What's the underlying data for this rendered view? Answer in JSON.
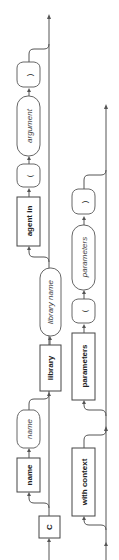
{
  "diagram": {
    "type": "railroad-syntax-diagram",
    "orientation": "rotated-90-ccw",
    "tracks": [
      {
        "id": "track-1",
        "nodes": [
          {
            "kind": "keyword",
            "label": "C"
          },
          {
            "kind": "keyword",
            "label": "name"
          },
          {
            "kind": "variable",
            "label": "name"
          },
          {
            "kind": "keyword",
            "label": "library"
          },
          {
            "kind": "variable",
            "label": "library name"
          },
          {
            "kind": "keyword",
            "label": "agent in"
          },
          {
            "kind": "punct",
            "label": "("
          },
          {
            "kind": "variable",
            "label": "argument"
          },
          {
            "kind": "punct",
            "label": ")"
          }
        ]
      },
      {
        "id": "track-2",
        "nodes": [
          {
            "kind": "keyword",
            "label": "with context"
          },
          {
            "kind": "keyword",
            "label": "parameters"
          },
          {
            "kind": "punct",
            "label": "("
          },
          {
            "kind": "variable",
            "label": "parameters"
          },
          {
            "kind": "punct",
            "label": ")"
          }
        ]
      }
    ],
    "colors": {
      "line": "#555555",
      "box_border": "#444444",
      "background": "#ffffff"
    }
  }
}
